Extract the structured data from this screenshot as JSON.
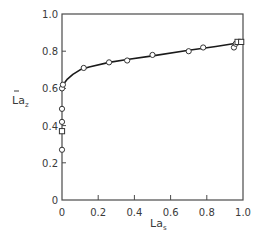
{
  "chart_data": {
    "type": "scatter",
    "title": "",
    "xlabel": "La",
    "xlabel_sub": "s",
    "ylabel": "La",
    "ylabel_sub": "z",
    "ylabel_overbar": true,
    "xlim": [
      0,
      1.0
    ],
    "ylim": [
      0,
      1.0
    ],
    "xticks": [
      0,
      0.2,
      0.4,
      0.6,
      0.8,
      1.0
    ],
    "xtick_labels": [
      "0",
      "0.2",
      "0.4",
      "0.6",
      "0.8",
      "1.0"
    ],
    "yticks": [
      0,
      0.2,
      0.4,
      0.6,
      0.8,
      1.0
    ],
    "ytick_labels": [
      "0",
      "0.2",
      "0.4",
      "0.6",
      "0.8",
      "1.0"
    ],
    "grid": false,
    "legend": null,
    "series": [
      {
        "name": "circles",
        "marker": "circle-open",
        "points": [
          [
            0,
            0.27
          ],
          [
            0,
            0.42
          ],
          [
            0,
            0.49
          ],
          [
            0,
            0.6
          ],
          [
            0.005,
            0.62
          ],
          [
            0.12,
            0.71
          ],
          [
            0.26,
            0.74
          ],
          [
            0.36,
            0.75
          ],
          [
            0.5,
            0.78
          ],
          [
            0.7,
            0.8
          ],
          [
            0.78,
            0.82
          ],
          [
            0.95,
            0.82
          ],
          [
            0.96,
            0.84
          ]
        ]
      },
      {
        "name": "squares",
        "marker": "square-open",
        "points": [
          [
            0,
            0.37
          ],
          [
            0.97,
            0.85
          ],
          [
            0.99,
            0.85
          ]
        ]
      },
      {
        "name": "fit-curve",
        "marker": "line",
        "points": [
          [
            0.0,
            0.6
          ],
          [
            0.01,
            0.625
          ],
          [
            0.03,
            0.65
          ],
          [
            0.06,
            0.675
          ],
          [
            0.1,
            0.7
          ],
          [
            0.15,
            0.715
          ],
          [
            0.26,
            0.74
          ],
          [
            0.36,
            0.755
          ],
          [
            0.5,
            0.775
          ],
          [
            0.7,
            0.805
          ],
          [
            0.85,
            0.825
          ],
          [
            0.98,
            0.845
          ]
        ]
      }
    ]
  }
}
